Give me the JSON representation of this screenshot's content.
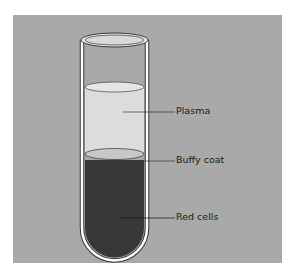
{
  "diagram": {
    "colors": {
      "background_panel": "#a9a9a9",
      "tube_outline": "#333333",
      "tube_glass": "#ffffff",
      "plasma": "#dcdcdc",
      "buffy_coat": "#c8c8c8",
      "red_cells": "#383838"
    },
    "labels": {
      "plasma": "Plasma",
      "buffy_coat": "Buffy coat",
      "red_cells": "Red cells"
    }
  }
}
